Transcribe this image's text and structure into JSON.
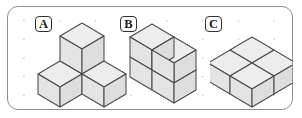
{
  "panel": {
    "border_color": "#8f8f8f",
    "background_color": "#ffffff",
    "dot_color": "#cfcfcf"
  },
  "figures": [
    {
      "label": "A",
      "label_position": {
        "x": 27,
        "y": 9
      },
      "cube_count": 3,
      "description": "three cubes: one upper-center, one lower-left, one lower-right forming a Y",
      "cube_positions": [
        {
          "x": 0,
          "y": 0,
          "z": 1
        },
        {
          "x": -1,
          "y": 0,
          "z": 0
        },
        {
          "x": 0,
          "y": -1,
          "z": 0
        }
      ]
    },
    {
      "label": "B",
      "label_position": {
        "x": 112,
        "y": 9
      },
      "cube_count": 4,
      "description": "two columns two cubes tall stacked block",
      "cube_positions": [
        {
          "x": 0,
          "y": 0,
          "z": 0
        },
        {
          "x": 0,
          "y": 1,
          "z": 0
        },
        {
          "x": 0,
          "y": 0,
          "z": 1
        },
        {
          "x": 0,
          "y": 1,
          "z": 1
        }
      ]
    },
    {
      "label": "C",
      "label_position": {
        "x": 197,
        "y": 9
      },
      "cube_count": 4,
      "description": "two by two flat single-layer slab of cubes",
      "cube_positions": [
        {
          "x": 0,
          "y": 0,
          "z": 0
        },
        {
          "x": 1,
          "y": 0,
          "z": 0
        },
        {
          "x": 0,
          "y": 1,
          "z": 0
        },
        {
          "x": 1,
          "y": 1,
          "z": 0
        }
      ]
    }
  ],
  "cube_style": {
    "top_face_color": "#ededed",
    "left_face_color": "#e4e4e4",
    "right_face_color": "#dedede",
    "edge_color": "#4a4a4a"
  }
}
